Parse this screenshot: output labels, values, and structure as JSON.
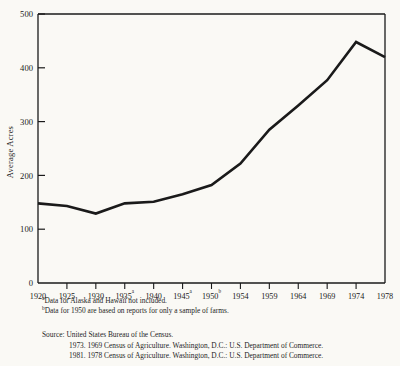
{
  "chart_data": {
    "type": "line",
    "title": "",
    "xlabel": "",
    "ylabel": "Average Acres",
    "x": [
      1920,
      1925,
      1930,
      1935,
      1940,
      1945,
      1950,
      1954,
      1959,
      1964,
      1969,
      1974,
      1978
    ],
    "categories": [
      "1920",
      "1925",
      "1930",
      "1935",
      "1940",
      "1945",
      "1950",
      "1954",
      "1959",
      "1964",
      "1969",
      "1974",
      "1978"
    ],
    "tick_superscripts": [
      "",
      "",
      "",
      "a",
      "",
      "a",
      "b",
      "",
      "",
      "",
      "",
      "",
      ""
    ],
    "values": [
      148,
      143,
      129,
      148,
      151,
      165,
      182,
      222,
      285,
      330,
      377,
      448,
      420
    ],
    "series": [
      {
        "name": "Average Acres per Farm",
        "values": [
          148,
          143,
          129,
          148,
          151,
          165,
          182,
          222,
          285,
          330,
          377,
          448,
          420
        ]
      }
    ],
    "ylim": [
      0,
      500
    ],
    "yticks": [
      0,
      100,
      200,
      300,
      400,
      500
    ],
    "ytick_labels": [
      "0",
      "100",
      "200",
      "300",
      "400",
      "500"
    ],
    "grid": false,
    "legend": false,
    "legend_position": "none",
    "line_color": "#1a1a1a",
    "axis_color": "#1a1a1a",
    "background_color": "#faf9f5"
  },
  "notes": [
    {
      "marker": "a",
      "text": "Data for Alaska and Hawaii not included."
    },
    {
      "marker": "b",
      "text": "Data for 1950 are based on reports for only a sample of farms."
    }
  ],
  "source": {
    "line1": "Source: United States Bureau of the Census.",
    "line2": "1973. 1969 Census of Agriculture. Washington, D.C.: U.S. Department of Commerce.",
    "line3": "1981. 1978 Census of Agriculture. Washington, D.C.: U.S. Department of Commerce."
  }
}
